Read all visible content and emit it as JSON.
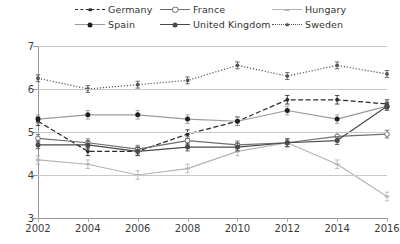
{
  "chart_data": {
    "type": "line",
    "title": "",
    "subtitle": "",
    "xlabel": "",
    "ylabel": "",
    "x": [
      2002,
      2004,
      2006,
      2008,
      2010,
      2012,
      2014,
      2016
    ],
    "xtick_labels": [
      "2002",
      "2004",
      "2006",
      "2008",
      "2010",
      "2012",
      "2014",
      "2016"
    ],
    "ytick_labels": [
      "3",
      "4",
      "5",
      "6",
      "7"
    ],
    "ylim": [
      3,
      7
    ],
    "xlim": [
      2002,
      2016
    ],
    "grid": "horizontal",
    "legend_position": "top",
    "error_bars": true,
    "series": [
      {
        "name": "Germany",
        "style": "dashed",
        "color": "#2b2b2b",
        "marker": "circle-small-filled",
        "values": [
          5.25,
          4.55,
          4.55,
          4.95,
          5.25,
          5.75,
          5.75,
          5.65
        ],
        "errors": [
          0.1,
          0.1,
          0.1,
          0.1,
          0.1,
          0.1,
          0.1,
          0.1
        ]
      },
      {
        "name": "France",
        "style": "solid",
        "color": "#6e6e6e",
        "marker": "circle-open",
        "values": [
          4.85,
          4.75,
          4.6,
          4.8,
          4.7,
          4.75,
          4.9,
          4.95
        ],
        "errors": [
          0.09,
          0.09,
          0.09,
          0.09,
          0.09,
          0.09,
          0.09,
          0.09
        ]
      },
      {
        "name": "Hungary",
        "style": "solid",
        "color": "#b4b4b4",
        "marker": "dash-small",
        "values": [
          4.35,
          4.25,
          4.0,
          4.15,
          4.55,
          4.75,
          4.25,
          3.5
        ],
        "errors": [
          0.1,
          0.1,
          0.1,
          0.1,
          0.1,
          0.1,
          0.1,
          0.1
        ]
      },
      {
        "name": "Spain",
        "style": "solid",
        "color": "#9a9a9a",
        "marker": "circle-filled",
        "values": [
          5.3,
          5.4,
          5.4,
          5.3,
          5.25,
          5.5,
          5.3,
          5.6
        ],
        "errors": [
          0.1,
          0.1,
          0.1,
          0.1,
          0.1,
          0.1,
          0.1,
          0.1
        ]
      },
      {
        "name": "United Kingdom",
        "style": "solid",
        "color": "#4a4a4a",
        "marker": "circle-filled",
        "values": [
          4.7,
          4.7,
          4.55,
          4.65,
          4.65,
          4.75,
          4.8,
          5.6
        ],
        "errors": [
          0.09,
          0.09,
          0.09,
          0.09,
          0.09,
          0.09,
          0.09,
          0.09
        ]
      },
      {
        "name": "Sweden",
        "style": "dotted",
        "color": "#555555",
        "marker": "circle-small-filled",
        "values": [
          6.25,
          6.0,
          6.1,
          6.2,
          6.55,
          6.3,
          6.55,
          6.35
        ],
        "errors": [
          0.08,
          0.08,
          0.08,
          0.08,
          0.08,
          0.08,
          0.08,
          0.08
        ]
      }
    ],
    "legend_order": [
      "Germany",
      "France",
      "Hungary",
      "Spain",
      "United Kingdom",
      "Sweden"
    ]
  }
}
